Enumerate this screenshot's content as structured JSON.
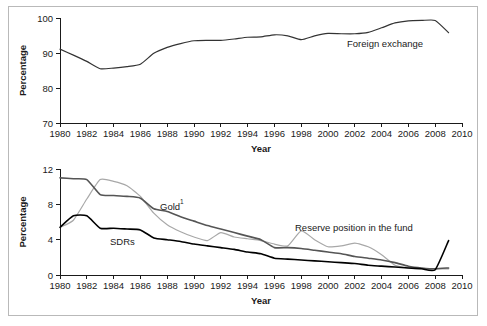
{
  "figure": {
    "background_color": "#ffffff",
    "border_color": "#b9b9b9"
  },
  "chart_data": [
    {
      "id": "top",
      "type": "line",
      "title": "",
      "xlabel": "Year",
      "ylabel": "Percentage",
      "xlim": [
        1980,
        2010
      ],
      "ylim": [
        70,
        100
      ],
      "xticks": [
        1980,
        1982,
        1984,
        1986,
        1988,
        1990,
        1992,
        1994,
        1996,
        1998,
        2000,
        2002,
        2004,
        2006,
        2008,
        2010
      ],
      "yticks": [
        70,
        80,
        90,
        100
      ],
      "grid": false,
      "legend": "inline-annotation",
      "x": [
        1980,
        1981,
        1982,
        1983,
        1984,
        1985,
        1986,
        1987,
        1988,
        1989,
        1990,
        1991,
        1992,
        1993,
        1994,
        1995,
        1996,
        1997,
        1998,
        1999,
        2000,
        2001,
        2002,
        2003,
        2004,
        2005,
        2006,
        2007,
        2008,
        2009
      ],
      "series": [
        {
          "name": "Foreign exchange",
          "color": "#333333",
          "width": 1.2,
          "label_text": "Foreign exchange",
          "values": [
            91.1,
            89.4,
            87.6,
            85.5,
            85.7,
            86.1,
            86.8,
            89.9,
            91.6,
            92.7,
            93.5,
            93.6,
            93.6,
            94.0,
            94.5,
            94.6,
            95.2,
            94.9,
            93.8,
            94.9,
            95.6,
            95.5,
            95.5,
            95.9,
            97.2,
            98.6,
            99.2,
            99.3,
            99.3,
            95.8
          ]
        }
      ]
    },
    {
      "id": "bottom",
      "type": "line",
      "title": "",
      "xlabel": "Year",
      "ylabel": "Percentage",
      "xlim": [
        1980,
        2010
      ],
      "ylim": [
        0,
        12
      ],
      "xticks": [
        1980,
        1982,
        1984,
        1986,
        1988,
        1990,
        1992,
        1994,
        1996,
        1998,
        2000,
        2002,
        2004,
        2006,
        2008,
        2010
      ],
      "yticks": [
        0,
        4,
        8,
        12
      ],
      "grid": false,
      "legend": "inline-annotation",
      "footnote_marker": "1",
      "x": [
        1980,
        1981,
        1982,
        1983,
        1984,
        1985,
        1986,
        1987,
        1988,
        1989,
        1990,
        1991,
        1992,
        1993,
        1994,
        1995,
        1996,
        1997,
        1998,
        1999,
        2000,
        2001,
        2002,
        2003,
        2004,
        2005,
        2006,
        2007,
        2008,
        2009
      ],
      "series": [
        {
          "name": "Gold",
          "color": "#a8a8a8",
          "width": 1.2,
          "label_text": "Gold",
          "label_superscript": "1",
          "values": [
            5.4,
            6.2,
            8.6,
            10.8,
            10.6,
            10.1,
            8.9,
            7.0,
            5.7,
            4.9,
            4.3,
            3.9,
            4.8,
            4.3,
            4.1,
            3.9,
            3.5,
            3.3,
            5.0,
            4.0,
            3.2,
            3.3,
            3.6,
            3.2,
            2.3,
            1.1,
            0.8,
            0.7,
            0.7,
            0.7
          ]
        },
        {
          "name": "Reserve position in the fund",
          "color": "#555555",
          "width": 1.6,
          "label_text": "Reserve position in the fund",
          "values": [
            11.0,
            10.9,
            10.8,
            9.1,
            9.0,
            8.9,
            8.7,
            7.5,
            7.2,
            6.6,
            6.1,
            5.6,
            5.2,
            4.8,
            4.4,
            4.0,
            3.1,
            3.1,
            3.0,
            2.8,
            2.6,
            2.4,
            2.1,
            1.9,
            1.7,
            1.4,
            1.0,
            0.8,
            0.7,
            0.8
          ]
        },
        {
          "name": "SDRs",
          "color": "#000000",
          "width": 1.6,
          "label_text": "SDRs",
          "values": [
            5.4,
            6.7,
            6.7,
            5.3,
            5.3,
            5.2,
            5.1,
            4.2,
            4.0,
            3.8,
            3.5,
            3.3,
            3.1,
            2.9,
            2.6,
            2.4,
            1.9,
            1.8,
            1.7,
            1.6,
            1.5,
            1.4,
            1.3,
            1.1,
            1.0,
            0.9,
            0.8,
            0.7,
            0.6,
            3.9
          ]
        }
      ]
    }
  ]
}
